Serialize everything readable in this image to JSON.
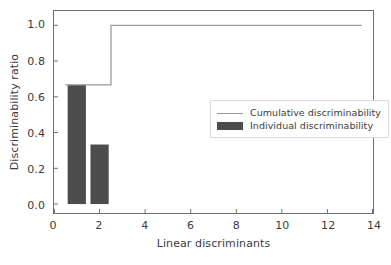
{
  "chart_data": {
    "type": "bar",
    "title": "",
    "xlabel": "Linear discriminants",
    "ylabel": "Discriminability ratio",
    "xlim": [
      0,
      14
    ],
    "ylim": [
      -0.05,
      1.08
    ],
    "xticks": [
      0,
      2,
      4,
      6,
      8,
      10,
      12,
      14
    ],
    "xtick_labels": [
      "0",
      "2",
      "4",
      "6",
      "8",
      "10",
      "12",
      "14"
    ],
    "yticks": [
      0.0,
      0.2,
      0.4,
      0.6,
      0.8,
      1.0
    ],
    "ytick_labels": [
      "0.0",
      "0.2",
      "0.4",
      "0.6",
      "0.8",
      "1.0"
    ],
    "grid": false,
    "legend_position": "center right",
    "series": [
      {
        "name": "Individual discriminability",
        "type": "bar",
        "color": "#4c4c4c",
        "x": [
          1,
          2
        ],
        "values": [
          0.667,
          0.333
        ],
        "bar_width": 0.8
      },
      {
        "name": "Cumulative discriminability",
        "type": "step",
        "color": "#9a9a9a",
        "x": [
          1,
          2,
          3,
          4,
          5,
          6,
          7,
          8,
          9,
          10,
          11,
          12,
          13
        ],
        "values": [
          0.667,
          1.0,
          1.0,
          1.0,
          1.0,
          1.0,
          1.0,
          1.0,
          1.0,
          1.0,
          1.0,
          1.0,
          1.0
        ]
      }
    ]
  },
  "legend": {
    "entries": [
      {
        "label": "Cumulative discriminability",
        "marker": "line"
      },
      {
        "label": "Individual discriminability",
        "marker": "patch"
      }
    ]
  },
  "colors": {
    "background": "#ffffff",
    "axis": "#6e6e6e",
    "text": "#3b3b3b",
    "bar": "#4c4c4c",
    "line": "#9a9a9a",
    "legend_border": "#d8d8d8"
  }
}
